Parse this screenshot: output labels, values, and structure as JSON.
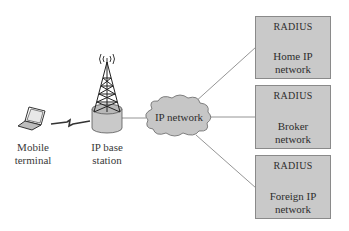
{
  "diagram": {
    "nodes": {
      "mobile_terminal": {
        "label_line1": "Mobile",
        "label_line2": "terminal",
        "icon": "laptop-icon"
      },
      "base_station": {
        "label_line1": "IP base",
        "label_line2": "station",
        "icon": "antenna-tower-icon"
      },
      "ip_network": {
        "label": "IP network",
        "icon": "cloud-icon"
      },
      "home_network": {
        "server_label": "RADIUS",
        "label_line1": "Home IP",
        "label_line2": "network"
      },
      "broker_network": {
        "server_label": "RADIUS",
        "label_line1": "Broker",
        "label_line2": "network"
      },
      "foreign_network": {
        "server_label": "RADIUS",
        "label_line1": "Foreign IP",
        "label_line2": "network"
      }
    },
    "edges": [
      {
        "from": "mobile_terminal",
        "to": "base_station",
        "type": "wireless"
      },
      {
        "from": "base_station",
        "to": "ip_network",
        "type": "wired"
      },
      {
        "from": "ip_network",
        "to": "home_network",
        "type": "wired"
      },
      {
        "from": "ip_network",
        "to": "broker_network",
        "type": "wired"
      },
      {
        "from": "ip_network",
        "to": "foreign_network",
        "type": "wired"
      }
    ],
    "colors": {
      "box_fill": "#c9c9c9",
      "cloud_fill": "#c6c6c6",
      "line": "#6b6b6b"
    }
  }
}
